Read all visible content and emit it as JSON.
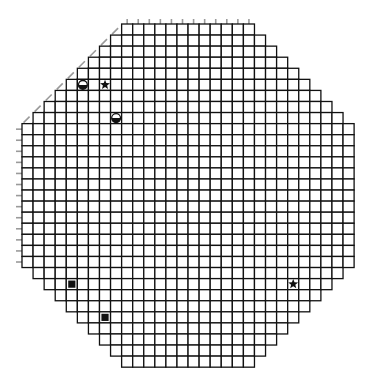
{
  "board": {
    "origin_x": 22,
    "origin_y": 24,
    "cell": 11.07,
    "cols": 30,
    "rows": 31,
    "line_color": "#111111",
    "tick_color": "#9a9a9a",
    "columns": [
      {
        "col": 0,
        "top": 9,
        "bottom": 22
      },
      {
        "col": 1,
        "top": 8,
        "bottom": 23
      },
      {
        "col": 2,
        "top": 7,
        "bottom": 24
      },
      {
        "col": 3,
        "top": 6,
        "bottom": 25
      },
      {
        "col": 4,
        "top": 5,
        "bottom": 26
      },
      {
        "col": 5,
        "top": 4,
        "bottom": 27
      },
      {
        "col": 6,
        "top": 3,
        "bottom": 28
      },
      {
        "col": 7,
        "top": 2,
        "bottom": 29
      },
      {
        "col": 8,
        "top": 1,
        "bottom": 30
      },
      {
        "col": 9,
        "top": 0,
        "bottom": 31
      },
      {
        "col": 10,
        "top": 0,
        "bottom": 31
      },
      {
        "col": 11,
        "top": 0,
        "bottom": 31
      },
      {
        "col": 12,
        "top": 0,
        "bottom": 31
      },
      {
        "col": 13,
        "top": 0,
        "bottom": 31
      },
      {
        "col": 14,
        "top": 0,
        "bottom": 31
      },
      {
        "col": 15,
        "top": 0,
        "bottom": 31
      },
      {
        "col": 16,
        "top": 0,
        "bottom": 31
      },
      {
        "col": 17,
        "top": 0,
        "bottom": 31
      },
      {
        "col": 18,
        "top": 0,
        "bottom": 31
      },
      {
        "col": 19,
        "top": 0,
        "bottom": 31
      },
      {
        "col": 20,
        "top": 0,
        "bottom": 31
      },
      {
        "col": 21,
        "top": 1,
        "bottom": 30
      },
      {
        "col": 22,
        "top": 2,
        "bottom": 29
      },
      {
        "col": 23,
        "top": 3,
        "bottom": 28
      },
      {
        "col": 24,
        "top": 4,
        "bottom": 27
      },
      {
        "col": 25,
        "top": 5,
        "bottom": 26
      },
      {
        "col": 26,
        "top": 6,
        "bottom": 25
      },
      {
        "col": 27,
        "top": 7,
        "bottom": 24
      },
      {
        "col": 28,
        "top": 8,
        "bottom": 23
      },
      {
        "col": 29,
        "top": 9,
        "bottom": 22
      }
    ],
    "pieces": [
      {
        "type": "half-circle",
        "icon": "half-circle-icon",
        "col": 5,
        "row": 5
      },
      {
        "type": "star",
        "icon": "star-icon",
        "col": 7,
        "row": 5
      },
      {
        "type": "half-circle",
        "icon": "half-circle-icon",
        "col": 8,
        "row": 8
      },
      {
        "type": "square",
        "icon": "square-icon",
        "col": 4,
        "row": 23
      },
      {
        "type": "square",
        "icon": "square-icon",
        "col": 7,
        "row": 26
      },
      {
        "type": "star",
        "icon": "star-icon",
        "col": 24,
        "row": 23
      }
    ]
  }
}
